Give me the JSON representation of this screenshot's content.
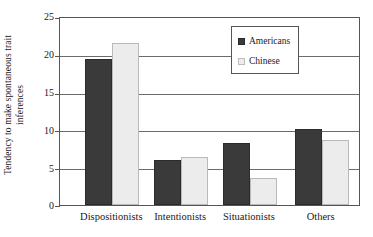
{
  "chart_data": {
    "type": "bar",
    "title": "",
    "subtitle": "",
    "xlabel": "",
    "ylabel": "Tendency to make spontaneous trait inferences",
    "ylabel_lines": [
      "Tendency to make spontaneous trait",
      "inferences"
    ],
    "categories": [
      "Dispositionists",
      "Intentionists",
      "Situationists",
      "Others"
    ],
    "series": [
      {
        "name": "Americans",
        "color": "#3a3a3a",
        "values": [
          19.5,
          6.0,
          8.3,
          10.2
        ]
      },
      {
        "name": "Chinese",
        "color": "#ececec",
        "values": [
          21.7,
          6.4,
          3.6,
          8.7
        ]
      }
    ],
    "ylim": [
      0,
      25
    ],
    "yticks": [
      0,
      5,
      10,
      15,
      20,
      25
    ],
    "ytick_labels": [
      "0",
      "5",
      "10",
      "15",
      "20",
      "25"
    ],
    "grid": true,
    "grid_axis": "y",
    "legend_position": "upper-center"
  },
  "legend": {
    "entries": [
      {
        "label": "Americans",
        "swatch": "dark-square-swatch"
      },
      {
        "label": "Chinese",
        "swatch": "light-square-swatch"
      }
    ]
  }
}
